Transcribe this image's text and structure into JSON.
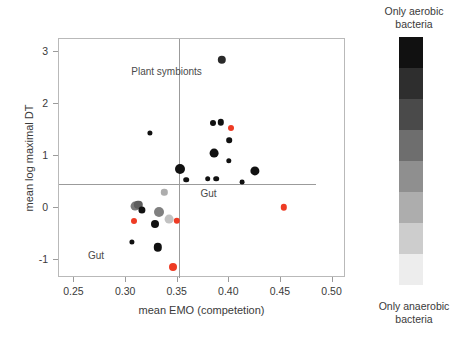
{
  "chart_data": {
    "type": "scatter",
    "title": "",
    "xlabel": "mean EMO (competetion)",
    "ylabel": "mean log maximal DT",
    "xlim": [
      0.235,
      0.513
    ],
    "ylim": [
      -1.35,
      3.25
    ],
    "xticks": [
      0.25,
      0.3,
      0.35,
      0.4,
      0.45,
      0.5
    ],
    "xticklabels": [
      "0.25",
      "0.30",
      "0.35",
      "0.40",
      "0.45",
      "0.50"
    ],
    "yticks": [
      -1,
      0,
      1,
      2,
      3
    ],
    "yticklabels": [
      "-1",
      "0",
      "1",
      "2",
      "3"
    ],
    "grid": false,
    "legend_position": "right",
    "reference_lines": [
      {
        "orientation": "vertical",
        "x": 0.351
      },
      {
        "orientation": "horizontal",
        "y": 0.45
      }
    ],
    "annotations": [
      {
        "text": "Plant symbionts",
        "x": 0.305,
        "y": 2.62
      },
      {
        "text": "Gut",
        "x": 0.372,
        "y": 0.27
      },
      {
        "text": "Gut",
        "x": 0.263,
        "y": -0.92
      }
    ],
    "colorscale": {
      "name": "grayscale-aerobic-anaerobic",
      "top_label": "Only aerobic bacteria",
      "bottom_label": "Only anaerobic bacteria",
      "bands": [
        "#111111",
        "#2e2e2e",
        "#4a4a4a",
        "#6e6e6e",
        "#8f8f8f",
        "#adadad",
        "#cdcdcd",
        "#ededed"
      ]
    },
    "point_colors": {
      "black": "#111111",
      "dark_gray": "#555555",
      "mid_gray": "#8c8c8c",
      "light_gray": "#b9b9b9",
      "red": "#ee3b24"
    },
    "points": [
      {
        "x": 0.3925,
        "y": 2.845,
        "r": 4.2,
        "color": "#2a2a2a"
      },
      {
        "x": 0.3843,
        "y": 1.64,
        "r": 3.0,
        "color": "#111111"
      },
      {
        "x": 0.3915,
        "y": 1.645,
        "r": 3.2,
        "color": "#111111"
      },
      {
        "x": 0.4015,
        "y": 1.54,
        "r": 3.0,
        "color": "#ee3b24"
      },
      {
        "x": 0.4,
        "y": 1.3,
        "r": 2.8,
        "color": "#111111"
      },
      {
        "x": 0.323,
        "y": 1.435,
        "r": 2.6,
        "color": "#111111"
      },
      {
        "x": 0.3855,
        "y": 1.055,
        "r": 4.4,
        "color": "#111111"
      },
      {
        "x": 0.3995,
        "y": 0.9,
        "r": 2.7,
        "color": "#111111"
      },
      {
        "x": 0.352,
        "y": 0.745,
        "r": 5.0,
        "color": "#111111"
      },
      {
        "x": 0.425,
        "y": 0.705,
        "r": 4.6,
        "color": "#111111"
      },
      {
        "x": 0.358,
        "y": 0.545,
        "r": 2.8,
        "color": "#111111"
      },
      {
        "x": 0.379,
        "y": 0.565,
        "r": 2.8,
        "color": "#111111"
      },
      {
        "x": 0.387,
        "y": 0.565,
        "r": 2.8,
        "color": "#111111"
      },
      {
        "x": 0.412,
        "y": 0.5,
        "r": 2.4,
        "color": "#111111"
      },
      {
        "x": 0.337,
        "y": 0.3,
        "r": 3.2,
        "color": "#adadad"
      },
      {
        "x": 0.453,
        "y": 0.01,
        "r": 3.2,
        "color": "#ee3b24"
      },
      {
        "x": 0.3085,
        "y": 0.03,
        "r": 4.4,
        "color": "#7a7a7a"
      },
      {
        "x": 0.312,
        "y": 0.055,
        "r": 4.2,
        "color": "#5d5d5d"
      },
      {
        "x": 0.315,
        "y": -0.04,
        "r": 3.6,
        "color": "#111111"
      },
      {
        "x": 0.332,
        "y": -0.08,
        "r": 5.0,
        "color": "#808080"
      },
      {
        "x": 0.3415,
        "y": -0.21,
        "r": 4.4,
        "color": "#c2c2c2"
      },
      {
        "x": 0.3075,
        "y": -0.26,
        "r": 3.0,
        "color": "#ee3b24"
      },
      {
        "x": 0.349,
        "y": -0.245,
        "r": 3.2,
        "color": "#ee3b24"
      },
      {
        "x": 0.328,
        "y": -0.32,
        "r": 4.0,
        "color": "#111111"
      },
      {
        "x": 0.306,
        "y": -0.65,
        "r": 2.6,
        "color": "#111111"
      },
      {
        "x": 0.3305,
        "y": -0.76,
        "r": 4.2,
        "color": "#111111"
      },
      {
        "x": 0.3455,
        "y": -1.145,
        "r": 4.0,
        "color": "#ee3b24"
      }
    ]
  }
}
